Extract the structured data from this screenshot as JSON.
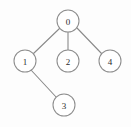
{
  "figure": {
    "type": "node-link-tree-diagram",
    "width": 131,
    "height": 127,
    "background_color": "#fdfdfd",
    "node_fill_color": "#ffffff",
    "node_stroke_color": "#8d8d8d",
    "edge_stroke_color": "#8a8a8a",
    "label_color": "#2b2b2b",
    "node_radius": 11
  },
  "nodes": [
    {
      "id": "0",
      "label": "0",
      "cx": 68,
      "cy": 21,
      "r": 11,
      "name": "node-0"
    },
    {
      "id": "1",
      "label": "1",
      "cx": 25,
      "cy": 61,
      "r": 11,
      "name": "node-1"
    },
    {
      "id": "2",
      "label": "2",
      "cx": 68,
      "cy": 61,
      "r": 11,
      "name": "node-2"
    },
    {
      "id": "4",
      "label": "4",
      "cx": 110,
      "cy": 61,
      "r": 11,
      "name": "node-4"
    },
    {
      "id": "3",
      "label": "3",
      "cx": 64,
      "cy": 105,
      "r": 11,
      "name": "node-3"
    }
  ],
  "edges": [
    {
      "from": "0",
      "to": "1",
      "x1": 60,
      "y1": 28,
      "x2": 33,
      "y2": 54,
      "name": "edge-0-1"
    },
    {
      "from": "0",
      "to": "2",
      "x1": 68,
      "y1": 32,
      "x2": 68,
      "y2": 50,
      "name": "edge-0-2"
    },
    {
      "from": "0",
      "to": "4",
      "x1": 77,
      "y1": 28,
      "x2": 102,
      "y2": 54,
      "name": "edge-0-4"
    },
    {
      "from": "1",
      "to": "3",
      "x1": 31,
      "y1": 70,
      "x2": 57,
      "y2": 98,
      "name": "edge-1-3"
    }
  ]
}
